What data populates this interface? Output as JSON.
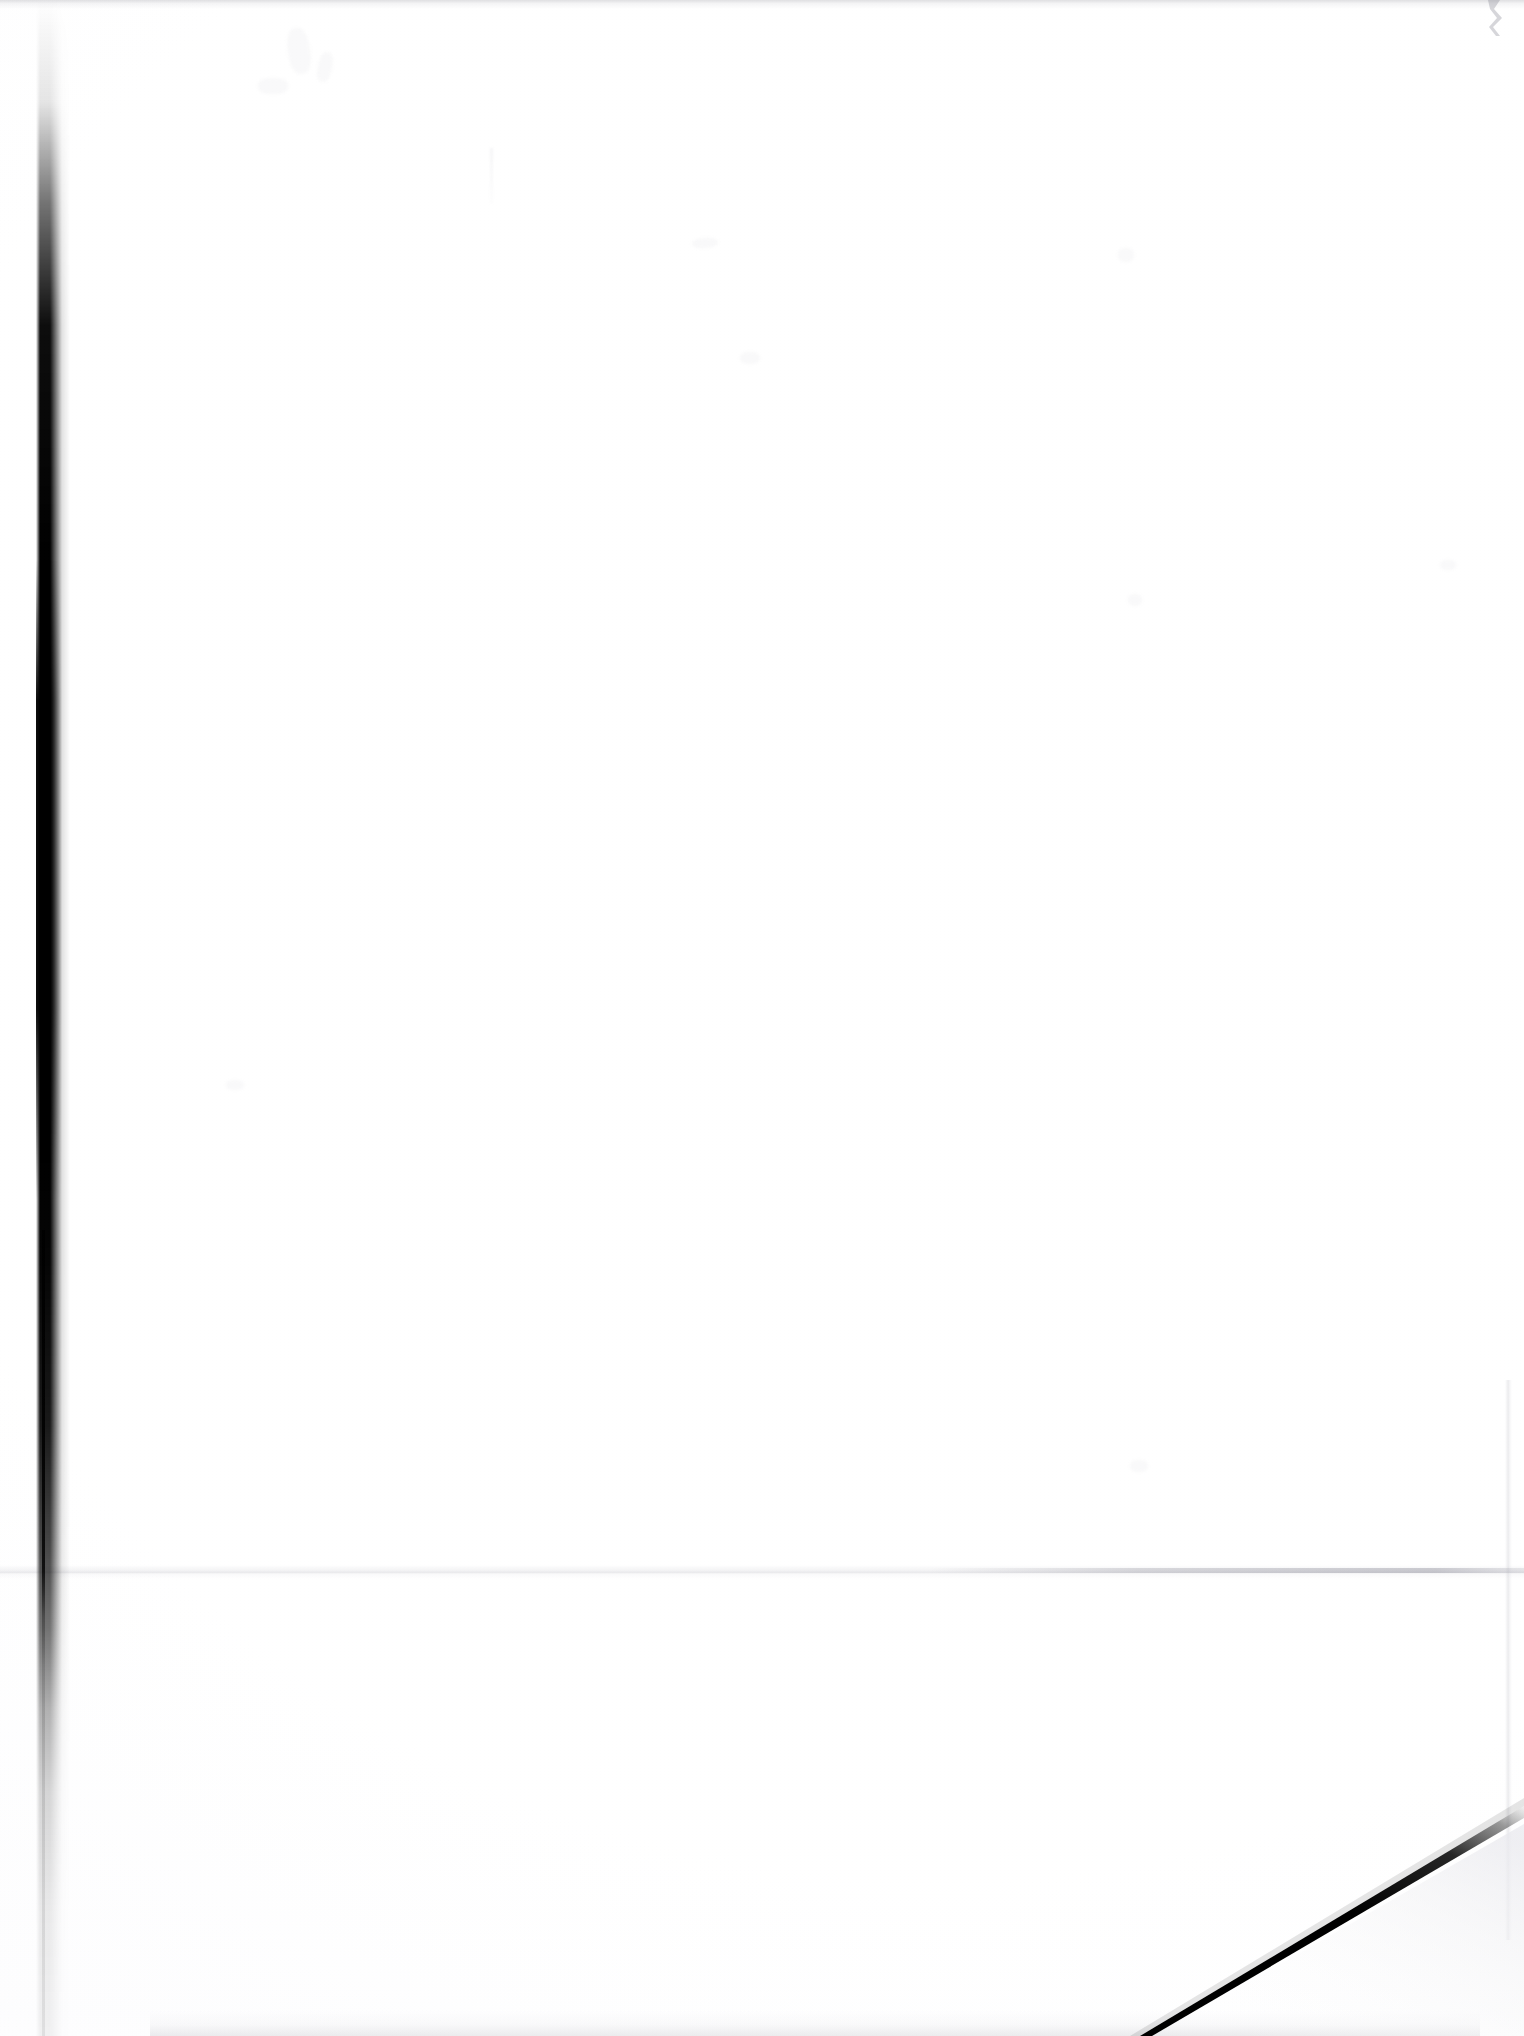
{
  "document": {
    "kind": "scanned-page",
    "page_content": "",
    "is_blank": true,
    "orientation": "portrait",
    "width_px": 1524,
    "height_px": 2036
  },
  "colors": {
    "paper": "#ffffff",
    "paper_shade": "#fbfbfc",
    "gutter_shadow": "#000000",
    "edge_wedge": "#000000",
    "crease": "#94949e",
    "edge_haze": "#a8a8b0"
  },
  "artifacts": [
    {
      "id": "gutter-shadow",
      "name": "left-gutter-shadow",
      "description": "Dark vertical spine/gutter shadow along the left side of the scan",
      "x": 38,
      "y": 0,
      "width": 24,
      "height": 2036
    },
    {
      "id": "gutter-hairline",
      "name": "left-gutter-hairline",
      "description": "Thin residual dark line continuing from the gutter shadow to the bottom edge",
      "x": 42,
      "y": 1230,
      "width": 3,
      "height": 806
    },
    {
      "id": "fold-horizontal",
      "name": "horizontal-fold-crease",
      "description": "Faint horizontal fold crease crossing the full width of the sheet",
      "x": 0,
      "y": 1570,
      "width": 1524,
      "height": 4
    },
    {
      "id": "fold-vertical",
      "name": "vertical-fold-crease",
      "description": "Faint vertical crease near the right edge in the lower half",
      "x": 1508,
      "y": 1380,
      "width": 3,
      "height": 560
    },
    {
      "id": "corner-wedge",
      "name": "bottom-right-corner-edge",
      "description": "Black diagonal page-edge wedge at the bottom right corner of the scan",
      "x": 1152,
      "y": 1835,
      "width": 372,
      "height": 201
    },
    {
      "id": "top-edge-haze",
      "name": "top-edge-haze",
      "description": "Faint grey haze along the top edge of the scan",
      "x": 0,
      "y": 0,
      "width": 1524,
      "height": 9
    },
    {
      "id": "bottom-edge-haze",
      "name": "bottom-edge-haze",
      "description": "Faint grey mottling along the bottom edge of the scan",
      "x": 150,
      "y": 2010,
      "width": 1330,
      "height": 26
    },
    {
      "id": "top-right-notch",
      "name": "top-right-edge-notch",
      "description": "Small grey notch artifact at the top right edge",
      "x": 1486,
      "y": 0,
      "width": 24,
      "height": 36
    }
  ],
  "ghost_marks": {
    "label": "faint bleed-through ghosting",
    "count": 10
  }
}
